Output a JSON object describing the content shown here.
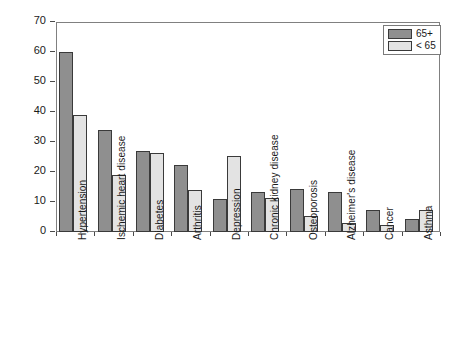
{
  "chart_data": {
    "type": "bar",
    "title": "",
    "xlabel": "",
    "ylabel": "Percent",
    "ylim": [
      0,
      70
    ],
    "yticks": [
      0,
      10,
      20,
      30,
      40,
      50,
      60,
      70
    ],
    "grid": false,
    "legend_position": "top-right",
    "categories": [
      "Hypertension",
      "Ischemic heart disease",
      "Diabetes",
      "Arthritis",
      "Depression",
      "Chronic kidney disease",
      "Osteoporosis",
      "Alzheimer's disease",
      "Cancer",
      "Asthma"
    ],
    "series": [
      {
        "name": "65+",
        "color": "#8f8f8f",
        "values": [
          60,
          34,
          27,
          22.5,
          11,
          13.5,
          14.5,
          13.5,
          7.5,
          4.5
        ]
      },
      {
        "name": "< 65",
        "color": "#e3e3e3",
        "values": [
          39,
          19,
          26.5,
          14,
          25.5,
          11.5,
          5.5,
          3,
          2.5,
          7.5
        ]
      }
    ]
  },
  "legend": {
    "items": [
      {
        "label": "65+"
      },
      {
        "label": "< 65"
      }
    ]
  },
  "axis": {
    "y_title": "Percent",
    "y_tick_labels": [
      "0",
      "10",
      "20",
      "30",
      "40",
      "50",
      "60",
      "70"
    ]
  }
}
